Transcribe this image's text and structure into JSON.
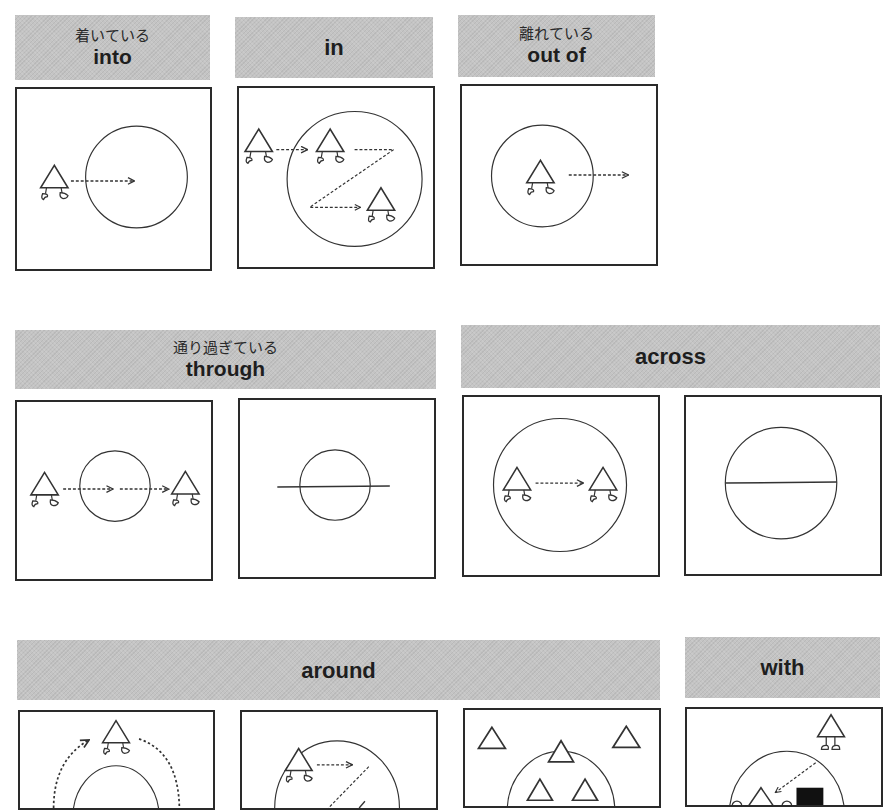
{
  "figure": {
    "rows": [
      {
        "groups": [
          {
            "id": "into",
            "label_ja": "着いている",
            "label_en": "into",
            "panels": [
              "into-1"
            ]
          },
          {
            "id": "in",
            "label_ja": "",
            "label_en": "in",
            "panels": [
              "in-1"
            ]
          },
          {
            "id": "out-of",
            "label_ja": "離れている",
            "label_en": "out of",
            "panels": [
              "out-of-1"
            ]
          }
        ]
      },
      {
        "groups": [
          {
            "id": "through",
            "label_ja": "通り過ぎている",
            "label_en": "through",
            "panels": [
              "through-1",
              "through-2"
            ]
          },
          {
            "id": "across",
            "label_ja": "",
            "label_en": "across",
            "panels": [
              "across-1",
              "across-2"
            ]
          }
        ]
      },
      {
        "groups": [
          {
            "id": "around",
            "label_ja": "",
            "label_en": "around",
            "panels": [
              "around-1",
              "around-2",
              "around-3"
            ]
          },
          {
            "id": "with",
            "label_ja": "",
            "label_en": "with",
            "panels": [
              "with-1"
            ]
          }
        ]
      }
    ]
  },
  "headers": {
    "into": {
      "ja": "着いている",
      "en": "into"
    },
    "in": {
      "en": "in"
    },
    "out_of": {
      "ja": "離れている",
      "en": "out of"
    },
    "through": {
      "ja": "通り過ぎている",
      "en": "through"
    },
    "across": {
      "en": "across"
    },
    "around": {
      "en": "around"
    },
    "with": {
      "en": "with"
    }
  },
  "colors": {
    "header_bg": "#c4c4c4",
    "line": "#333333",
    "text": "#1e1e1e",
    "filled_square": "#111111"
  },
  "icons": {
    "walker": "triangle-with-feet-icon",
    "dashed_arrow": "dashed-arrow-icon",
    "circle": "circle-region-icon",
    "line": "line-icon",
    "square": "filled-square-icon"
  }
}
